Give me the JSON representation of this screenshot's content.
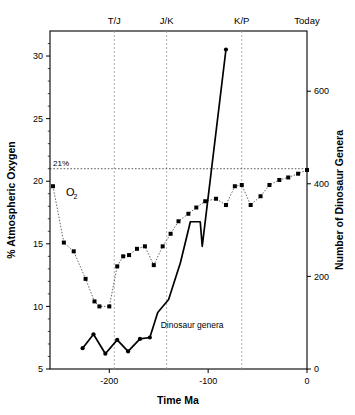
{
  "chart_data": {
    "type": "line",
    "title": "",
    "xlabel": "Time Ma",
    "ylabel_left": "% Atmospheric Oxygen",
    "ylabel_right": "Number of Dinosaur Genera",
    "xlim": [
      -260,
      0
    ],
    "ylim_left": [
      5,
      32
    ],
    "ylim_right": [
      0,
      730
    ],
    "xticks": [
      -200,
      -100,
      0
    ],
    "xticklabels": [
      "-200",
      "-100",
      "0"
    ],
    "yticks_left": [
      5,
      10,
      15,
      20,
      25,
      30
    ],
    "yticklabels_left": [
      "5",
      "10",
      "15",
      "20",
      "25",
      "30"
    ],
    "yticks_right": [
      0,
      200,
      400,
      600
    ],
    "yticklabels_right": [
      "0",
      "200",
      "400",
      "600"
    ],
    "grid": false,
    "legend_position": "inline-annotations",
    "era_markers": [
      {
        "label": "T/J",
        "x": -195
      },
      {
        "label": "J/K",
        "x": -142
      },
      {
        "label": "K/P",
        "x": -66
      },
      {
        "label": "Today",
        "x": 0
      }
    ],
    "reference_lines": [
      {
        "label": "21%",
        "axis": "left",
        "value": 21
      }
    ],
    "annotations": [
      {
        "label": "O",
        "subscript": "2",
        "x": -252,
        "y": 19.2,
        "axis": "left"
      },
      {
        "label": "Dinosaur genera",
        "x": -148,
        "y": 8.3,
        "axis": "left"
      }
    ],
    "series": [
      {
        "name": "Atmospheric Oxygen",
        "style": "dotted-with-markers",
        "axis": "left",
        "units": "%",
        "points": [
          {
            "x": -257,
            "y": 19.6
          },
          {
            "x": -246,
            "y": 15.1
          },
          {
            "x": -236,
            "y": 14.4
          },
          {
            "x": -224,
            "y": 12.2
          },
          {
            "x": -215,
            "y": 10.4
          },
          {
            "x": -210,
            "y": 10.0
          },
          {
            "x": -200,
            "y": 10.0
          },
          {
            "x": -192,
            "y": 13.2
          },
          {
            "x": -186,
            "y": 14.0
          },
          {
            "x": -180,
            "y": 14.1
          },
          {
            "x": -172,
            "y": 14.6
          },
          {
            "x": -164,
            "y": 14.8
          },
          {
            "x": -155,
            "y": 13.3
          },
          {
            "x": -146,
            "y": 14.8
          },
          {
            "x": -138,
            "y": 15.8
          },
          {
            "x": -130,
            "y": 16.8
          },
          {
            "x": -120,
            "y": 17.4
          },
          {
            "x": -112,
            "y": 17.9
          },
          {
            "x": -103,
            "y": 18.4
          },
          {
            "x": -92,
            "y": 18.6
          },
          {
            "x": -82,
            "y": 18.1
          },
          {
            "x": -73,
            "y": 19.6
          },
          {
            "x": -66,
            "y": 19.7
          },
          {
            "x": -57,
            "y": 18.1
          },
          {
            "x": -47,
            "y": 18.8
          },
          {
            "x": -38,
            "y": 19.7
          },
          {
            "x": -28,
            "y": 20.1
          },
          {
            "x": -19,
            "y": 20.3
          },
          {
            "x": -9,
            "y": 20.6
          },
          {
            "x": 0,
            "y": 20.9
          }
        ]
      },
      {
        "name": "Dinosaur genera",
        "style": "solid-with-markers",
        "axis": "right",
        "units": "genera",
        "points": [
          {
            "x": -227,
            "y": 45
          },
          {
            "x": -216,
            "y": 75
          },
          {
            "x": -204,
            "y": 33
          },
          {
            "x": -192,
            "y": 63
          },
          {
            "x": -181,
            "y": 38
          },
          {
            "x": -169,
            "y": 65
          },
          {
            "x": -159,
            "y": 68
          },
          {
            "x": -151,
            "y": 122
          },
          {
            "x": -140,
            "y": 150
          },
          {
            "x": -128,
            "y": 230
          },
          {
            "x": -118,
            "y": 318
          },
          {
            "x": -108,
            "y": 318
          },
          {
            "x": -106,
            "y": 265
          },
          {
            "x": -82,
            "y": 690
          }
        ]
      }
    ]
  }
}
